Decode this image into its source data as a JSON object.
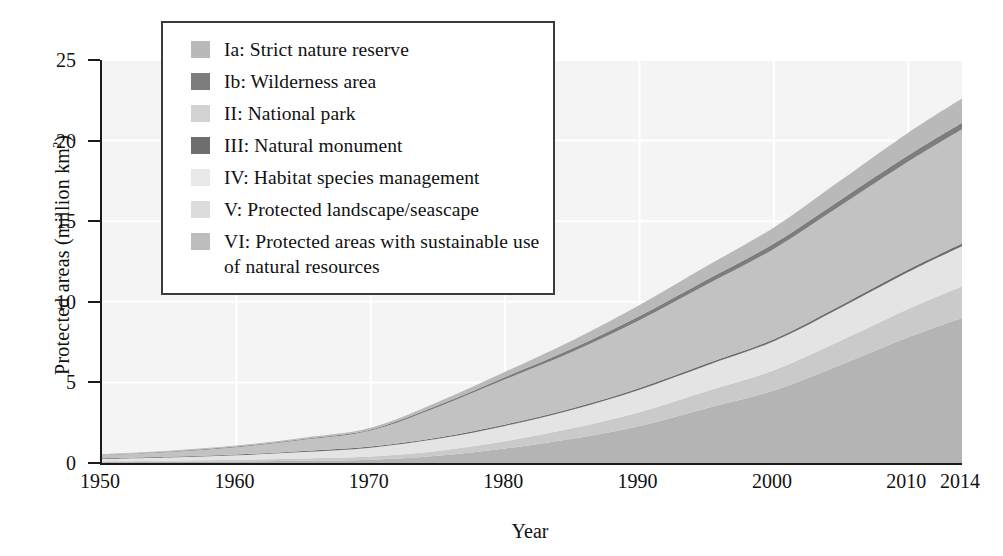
{
  "chart_data": {
    "type": "area",
    "title": "",
    "subtitle": "",
    "xlabel": "Year",
    "ylabel": "Protected areas (million km2)",
    "ylabel_display": "Protected areas (million km",
    "ylabel_sup": "2",
    "ylabel_tail": ")",
    "grid": true,
    "legend_position": "top-left-inside",
    "xlim": [
      1950,
      2014
    ],
    "ylim": [
      0,
      25
    ],
    "xticks": [
      1950,
      1960,
      1970,
      1980,
      1990,
      2000,
      2010,
      2014
    ],
    "xtick_labels": [
      "1950",
      "1960",
      "1970",
      "1980",
      "1990",
      "2000",
      "2010",
      "2014"
    ],
    "yticks": [
      0,
      5,
      10,
      15,
      20,
      25
    ],
    "ytick_labels": [
      "0",
      "5",
      "10",
      "15",
      "20",
      "25"
    ],
    "x": [
      1950,
      1955,
      1960,
      1965,
      1970,
      1975,
      1980,
      1985,
      1990,
      1995,
      2000,
      2005,
      2010,
      2014
    ],
    "stack_order_bottom_to_top": [
      "VI",
      "V",
      "IV",
      "III",
      "II",
      "Ib",
      "Ia"
    ],
    "series": [
      {
        "name": "VI: Protected areas with sustainable use of natural resources",
        "key": "VI",
        "color": "#b4b4b4",
        "values": [
          0.05,
          0.07,
          0.1,
          0.14,
          0.2,
          0.45,
          0.9,
          1.5,
          2.3,
          3.4,
          4.5,
          6.1,
          7.8,
          9.0
        ]
      },
      {
        "name": "V: Protected landscape/seascape",
        "key": "V",
        "color": "#cacaca",
        "values": [
          0.05,
          0.07,
          0.1,
          0.14,
          0.2,
          0.3,
          0.45,
          0.65,
          0.85,
          1.05,
          1.25,
          1.5,
          1.75,
          1.95
        ]
      },
      {
        "name": "IV: Habitat species management",
        "key": "IV",
        "color": "#e4e4e4",
        "values": [
          0.15,
          0.2,
          0.28,
          0.4,
          0.55,
          0.75,
          0.95,
          1.15,
          1.4,
          1.6,
          1.8,
          2.05,
          2.3,
          2.5
        ]
      },
      {
        "name": "III: Natural monument",
        "key": "III",
        "color": "#6e6e6e",
        "values": [
          0.04,
          0.04,
          0.05,
          0.06,
          0.07,
          0.08,
          0.09,
          0.1,
          0.11,
          0.12,
          0.13,
          0.14,
          0.15,
          0.16
        ]
      },
      {
        "name": "II: National park",
        "key": "II",
        "color": "#c2c2c2",
        "values": [
          0.2,
          0.3,
          0.45,
          0.7,
          1.0,
          1.9,
          2.8,
          3.5,
          4.2,
          4.9,
          5.6,
          6.2,
          6.7,
          7.1
        ]
      },
      {
        "name": "Ib: Wilderness area",
        "key": "Ib",
        "color": "#7d7d7d",
        "values": [
          0.02,
          0.03,
          0.04,
          0.05,
          0.06,
          0.1,
          0.14,
          0.2,
          0.26,
          0.3,
          0.33,
          0.36,
          0.39,
          0.4
        ]
      },
      {
        "name": "Ia: Strict nature reserve",
        "key": "Ia",
        "color": "#b9b9b9",
        "values": [
          0.04,
          0.05,
          0.06,
          0.08,
          0.1,
          0.2,
          0.33,
          0.5,
          0.68,
          0.85,
          1.0,
          1.2,
          1.4,
          1.5
        ]
      }
    ],
    "totals": [
      0.55,
      0.76,
      1.08,
      1.57,
      2.18,
      3.78,
      5.66,
      7.6,
      9.8,
      12.22,
      14.61,
      17.55,
      20.49,
      22.61
    ]
  },
  "legend": {
    "items": [
      {
        "label": "Ia: Strict nature reserve",
        "color": "#b9b9b9"
      },
      {
        "label": "Ib: Wilderness area",
        "color": "#7d7d7d"
      },
      {
        "label": "II: National park",
        "color": "#d2d2d2"
      },
      {
        "label": "III: Natural monument",
        "color": "#6e6e6e"
      },
      {
        "label": "IV: Habitat species management",
        "color": "#e8e8e8"
      },
      {
        "label": "V: Protected landscape/seascape",
        "color": "#dcdcdc"
      },
      {
        "label": "VI: Protected areas with sustainable use of natural resources",
        "color": "#bdbdbd"
      }
    ]
  },
  "theme": {
    "plot_background": "#f4f4f4",
    "grid_color": "#ffffff",
    "axis_color": "#1a1a1a",
    "text_color": "#111111",
    "page_background": "#ffffff"
  }
}
